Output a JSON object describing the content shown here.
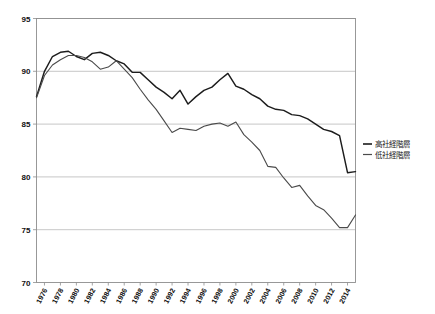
{
  "chart_data": {
    "type": "line",
    "title": "",
    "subtitle": "",
    "xlabel": "",
    "ylabel": "",
    "xlim": [
      1975,
      2015
    ],
    "ylim": [
      70,
      95
    ],
    "grid": true,
    "grid_axis": "y",
    "legend_position": "right",
    "y_ticks": [
      "70",
      "75",
      "80",
      "85",
      "90",
      "95"
    ],
    "y_tick_values": [
      70,
      75,
      80,
      85,
      90,
      95
    ],
    "x_ticks": [
      "1976",
      "1978",
      "1980",
      "1982",
      "1984",
      "1986",
      "1988",
      "1990",
      "1992",
      "1994",
      "1996",
      "1998",
      "2000",
      "2002",
      "2004",
      "2006",
      "2008",
      "2010",
      "2012",
      "2014"
    ],
    "x_tick_values": [
      1976,
      1978,
      1980,
      1982,
      1984,
      1986,
      1988,
      1990,
      1992,
      1994,
      1996,
      1998,
      2000,
      2002,
      2004,
      2006,
      2008,
      2010,
      2012,
      2014
    ],
    "x": [
      1975,
      1976,
      1977,
      1978,
      1979,
      1980,
      1981,
      1982,
      1983,
      1984,
      1985,
      1986,
      1987,
      1988,
      1989,
      1990,
      1991,
      1992,
      1993,
      1994,
      1995,
      1996,
      1997,
      1998,
      1999,
      2000,
      2001,
      2002,
      2003,
      2004,
      2005,
      2006,
      2007,
      2008,
      2009,
      2010,
      2011,
      2012,
      2013,
      2014,
      2015
    ],
    "series": [
      {
        "name": "高社経階層",
        "color": "#1c1c1c",
        "values": [
          87.6,
          90.0,
          91.4,
          91.8,
          91.9,
          91.4,
          91.1,
          91.7,
          91.8,
          91.5,
          91.0,
          90.7,
          89.9,
          89.9,
          89.2,
          88.5,
          88.0,
          87.4,
          88.2,
          86.9,
          87.6,
          88.2,
          88.5,
          89.2,
          89.8,
          88.6,
          88.3,
          87.8,
          87.4,
          86.7,
          86.4,
          86.3,
          85.9,
          85.8,
          85.5,
          85.0,
          84.5,
          84.3,
          83.9,
          80.4,
          80.5
        ]
      },
      {
        "name": "低社経階層",
        "color": "#4a4a4a",
        "values": [
          87.5,
          89.6,
          90.6,
          91.1,
          91.5,
          91.5,
          91.3,
          90.9,
          90.2,
          90.4,
          91.0,
          90.2,
          89.4,
          88.3,
          87.3,
          86.4,
          85.3,
          84.2,
          84.6,
          84.5,
          84.4,
          84.8,
          85.0,
          85.1,
          84.8,
          85.2,
          84.0,
          83.3,
          82.5,
          81.0,
          80.9,
          79.9,
          79.0,
          79.2,
          78.2,
          77.3,
          76.9,
          76.1,
          75.2,
          75.2,
          76.4
        ]
      }
    ],
    "legend": [
      "高社経階層",
      "低社経階層"
    ]
  },
  "legend": {
    "items": [
      {
        "label": "高社経階層",
        "color": "#1c1c1c"
      },
      {
        "label": "低社経階層",
        "color": "#4a4a4a"
      }
    ]
  }
}
